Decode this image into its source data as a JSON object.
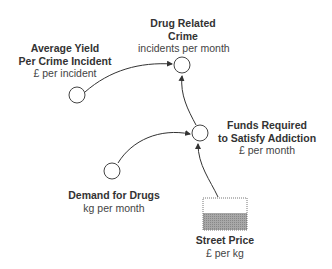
{
  "nodes": {
    "drug_related_crime": {
      "title_line1": "Drug Related",
      "title_line2": "Crime",
      "unit": "incidents per month",
      "type": "variable"
    },
    "average_yield": {
      "title_line1": "Average Yield",
      "title_line2": "Per Crime Incident",
      "unit": "£ per incident",
      "type": "variable"
    },
    "funds_required": {
      "title_line1": "Funds Required",
      "title_line2": "to Satisfy Addiction",
      "unit": "£ per month",
      "type": "variable"
    },
    "demand_for_drugs": {
      "title_line1": "Demand for Drugs",
      "unit": "kg per month",
      "type": "variable"
    },
    "street_price": {
      "title_line1": "Street Price",
      "unit": "£ per kg",
      "type": "stock"
    }
  },
  "links": [
    {
      "from": "average_yield",
      "to": "drug_related_crime"
    },
    {
      "from": "funds_required",
      "to": "drug_related_crime"
    },
    {
      "from": "demand_for_drugs",
      "to": "funds_required"
    },
    {
      "from": "street_price",
      "to": "funds_required"
    }
  ],
  "colors": {
    "line": "#333333",
    "stock_fill": "#999999",
    "circle_stroke": "#444444"
  }
}
